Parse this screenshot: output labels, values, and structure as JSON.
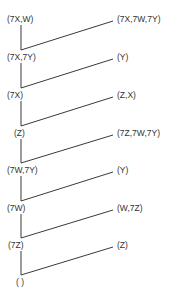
{
  "diagram": {
    "type": "derivation-tree",
    "colors": {
      "line": "#3a3a3a",
      "text": "#333333",
      "background": "#ffffff"
    },
    "left_nodes": [
      {
        "label": "(7X,W)",
        "y": 19
      },
      {
        "label": "(7X,7Y)",
        "y": 57
      },
      {
        "label": "(7X)",
        "y": 95
      },
      {
        "label": "(Z)",
        "y": 133
      },
      {
        "label": "(7W,7Y)",
        "y": 170
      },
      {
        "label": "(7W)",
        "y": 208
      },
      {
        "label": "(7Z)",
        "y": 245
      },
      {
        "label": "( )",
        "y": 282
      }
    ],
    "right_nodes": [
      {
        "label": "(7X,7W,7Y)",
        "y": 19
      },
      {
        "label": "(Y)",
        "y": 57
      },
      {
        "label": "(Z,X)",
        "y": 95
      },
      {
        "label": "(7Z,7W,7Y)",
        "y": 133
      },
      {
        "label": "(Y)",
        "y": 170
      },
      {
        "label": "(W,7Z)",
        "y": 208
      },
      {
        "label": "(Z)",
        "y": 245
      }
    ]
  }
}
